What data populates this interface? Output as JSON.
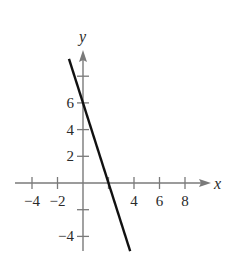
{
  "chart_data": {
    "type": "line",
    "title": "",
    "xlabel": "x",
    "ylabel": "y",
    "xlim": [
      -5,
      9.5
    ],
    "ylim": [
      -5,
      9.5
    ],
    "grid": false,
    "legend": null,
    "x_ticks": [
      -4,
      -2,
      2,
      4,
      6,
      8
    ],
    "x_tick_labels": [
      "−4",
      "−2",
      "",
      "4",
      "6",
      "8"
    ],
    "y_ticks": [
      -4,
      -2,
      2,
      4,
      6,
      8
    ],
    "y_tick_labels": [
      "−4",
      "",
      "2",
      "4",
      "6",
      ""
    ],
    "series": [
      {
        "name": "y = -3x + 6",
        "equation": "y = -3x + 6",
        "x": [
          -1.1,
          3.7
        ],
        "y": [
          9.3,
          -5.1
        ],
        "color": "#111111"
      }
    ],
    "key_points": {
      "y_intercept": [
        0,
        6
      ],
      "x_intercept": [
        2,
        0
      ]
    }
  },
  "labels": {
    "x_axis": "x",
    "y_axis": "y"
  },
  "colors": {
    "axis": "#7a7a7a",
    "line": "#111111",
    "text": "#2a2a2a"
  }
}
